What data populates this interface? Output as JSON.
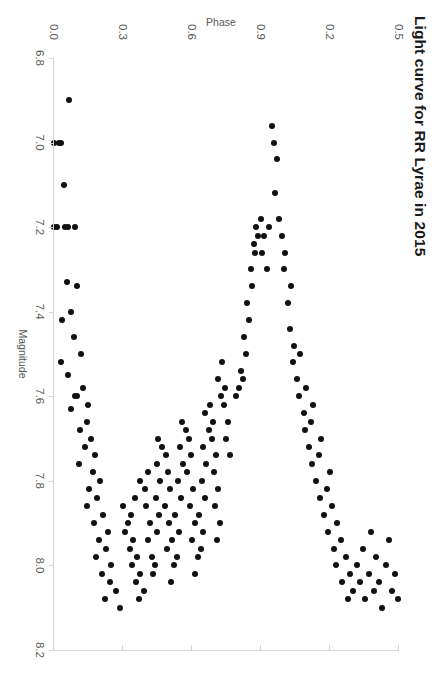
{
  "chart_data": {
    "type": "scatter",
    "title": "Light curve for RR Lyrae in 2015",
    "xlabel": "Magnitude",
    "ylabel": "Phase",
    "orientation": "rotated-90-clockwise",
    "grid": false,
    "legend": null,
    "xlim": [
      6.8,
      8.2
    ],
    "ylim": [
      0.0,
      1.5
    ],
    "xticks": [
      "6.8",
      "7.0",
      "7.2",
      "7.4",
      "7.6",
      "7.8",
      "8.0",
      "8.2"
    ],
    "xtick_values": [
      6.8,
      7.0,
      7.2,
      7.4,
      7.6,
      7.8,
      8.0,
      8.2
    ],
    "yticks": [
      "0.0",
      "0.3",
      "0.6",
      "0.9",
      "0.2",
      "0.5"
    ],
    "ytick_values": [
      0.0,
      0.3,
      0.6,
      0.9,
      1.2,
      1.5
    ],
    "marker": "filled-circle",
    "marker_color": "#111111",
    "marker_size_px": 6,
    "axis_color": "#d4d4d4",
    "tick_label_color": "#595959",
    "title_color": "#1a1a1a",
    "background": "#ffffff",
    "n_points": 163,
    "points": [
      [
        6.9,
        0.065
      ],
      [
        7.0,
        0.03
      ],
      [
        7.0,
        0.021
      ],
      [
        7.0,
        0.0
      ],
      [
        7.1,
        0.043
      ],
      [
        7.2,
        0.09
      ],
      [
        7.2,
        0.063
      ],
      [
        7.2,
        0.05
      ],
      [
        7.2,
        0.013
      ],
      [
        7.2,
        0.0
      ],
      [
        7.34,
        0.1
      ],
      [
        7.33,
        0.055
      ],
      [
        7.4,
        0.072
      ],
      [
        7.42,
        0.036
      ],
      [
        7.46,
        0.088
      ],
      [
        7.5,
        0.118
      ],
      [
        7.52,
        0.03
      ],
      [
        7.55,
        0.06
      ],
      [
        7.58,
        0.128
      ],
      [
        7.6,
        0.1
      ],
      [
        7.6,
        0.092
      ],
      [
        7.62,
        0.148
      ],
      [
        7.63,
        0.072
      ],
      [
        7.66,
        0.142
      ],
      [
        7.68,
        0.115
      ],
      [
        7.7,
        0.16
      ],
      [
        7.72,
        0.135
      ],
      [
        7.74,
        0.178
      ],
      [
        7.76,
        0.108
      ],
      [
        7.78,
        0.17
      ],
      [
        7.8,
        0.2
      ],
      [
        7.82,
        0.152
      ],
      [
        7.84,
        0.188
      ],
      [
        7.86,
        0.145
      ],
      [
        7.88,
        0.215
      ],
      [
        7.9,
        0.175
      ],
      [
        7.92,
        0.235
      ],
      [
        7.94,
        0.196
      ],
      [
        7.96,
        0.228
      ],
      [
        7.98,
        0.182
      ],
      [
        8.0,
        0.25
      ],
      [
        8.02,
        0.21
      ],
      [
        8.04,
        0.245
      ],
      [
        8.06,
        0.268
      ],
      [
        8.08,
        0.222
      ],
      [
        8.1,
        0.286
      ],
      [
        7.86,
        0.3
      ],
      [
        7.9,
        0.32
      ],
      [
        7.92,
        0.31
      ],
      [
        7.94,
        0.345
      ],
      [
        7.96,
        0.33
      ],
      [
        7.98,
        0.362
      ],
      [
        8.0,
        0.34
      ],
      [
        8.02,
        0.375
      ],
      [
        8.04,
        0.355
      ],
      [
        8.06,
        0.39
      ],
      [
        8.08,
        0.368
      ],
      [
        7.88,
        0.335
      ],
      [
        7.84,
        0.352
      ],
      [
        7.8,
        0.372
      ],
      [
        7.82,
        0.395
      ],
      [
        7.78,
        0.41
      ],
      [
        7.86,
        0.402
      ],
      [
        7.9,
        0.418
      ],
      [
        7.94,
        0.408
      ],
      [
        7.98,
        0.425
      ],
      [
        8.0,
        0.44
      ],
      [
        8.02,
        0.432
      ],
      [
        7.92,
        0.448
      ],
      [
        7.88,
        0.455
      ],
      [
        7.84,
        0.442
      ],
      [
        7.8,
        0.462
      ],
      [
        7.76,
        0.448
      ],
      [
        7.72,
        0.47
      ],
      [
        7.7,
        0.452
      ],
      [
        7.74,
        0.488
      ],
      [
        7.78,
        0.495
      ],
      [
        7.82,
        0.505
      ],
      [
        7.86,
        0.482
      ],
      [
        7.9,
        0.5
      ],
      [
        7.94,
        0.515
      ],
      [
        7.96,
        0.492
      ],
      [
        8.0,
        0.52
      ],
      [
        8.04,
        0.508
      ],
      [
        7.98,
        0.535
      ],
      [
        7.92,
        0.545
      ],
      [
        7.88,
        0.528
      ],
      [
        7.84,
        0.552
      ],
      [
        7.8,
        0.54
      ],
      [
        7.76,
        0.562
      ],
      [
        7.72,
        0.548
      ],
      [
        7.68,
        0.572
      ],
      [
        7.66,
        0.555
      ],
      [
        7.7,
        0.588
      ],
      [
        7.74,
        0.595
      ],
      [
        7.78,
        0.58
      ],
      [
        7.82,
        0.605
      ],
      [
        7.86,
        0.592
      ],
      [
        7.9,
        0.612
      ],
      [
        7.94,
        0.6
      ],
      [
        7.98,
        0.625
      ],
      [
        8.02,
        0.615
      ],
      [
        7.96,
        0.638
      ],
      [
        7.92,
        0.648
      ],
      [
        7.88,
        0.632
      ],
      [
        7.84,
        0.655
      ],
      [
        7.8,
        0.642
      ],
      [
        7.76,
        0.662
      ],
      [
        7.72,
        0.65
      ],
      [
        7.68,
        0.672
      ],
      [
        7.64,
        0.658
      ],
      [
        7.62,
        0.68
      ],
      [
        7.66,
        0.692
      ],
      [
        7.7,
        0.685
      ],
      [
        7.74,
        0.705
      ],
      [
        7.78,
        0.695
      ],
      [
        7.82,
        0.715
      ],
      [
        7.86,
        0.702
      ],
      [
        7.9,
        0.722
      ],
      [
        7.94,
        0.71
      ],
      [
        7.6,
        0.728
      ],
      [
        7.56,
        0.712
      ],
      [
        7.58,
        0.745
      ],
      [
        7.62,
        0.738
      ],
      [
        7.66,
        0.758
      ],
      [
        7.7,
        0.748
      ],
      [
        7.74,
        0.765
      ],
      [
        7.52,
        0.73
      ],
      [
        7.6,
        0.79
      ],
      [
        7.58,
        0.805
      ],
      [
        7.56,
        0.82
      ],
      [
        7.54,
        0.812
      ],
      [
        7.5,
        0.835
      ],
      [
        7.46,
        0.828
      ],
      [
        7.42,
        0.848
      ],
      [
        7.38,
        0.84
      ],
      [
        7.34,
        0.862
      ],
      [
        7.3,
        0.855
      ],
      [
        7.26,
        0.875
      ],
      [
        7.24,
        0.868
      ],
      [
        7.22,
        0.888
      ],
      [
        7.2,
        0.88
      ],
      [
        7.18,
        0.9
      ],
      [
        7.22,
        0.912
      ],
      [
        7.26,
        0.905
      ],
      [
        7.3,
        0.925
      ],
      [
        7.2,
        0.935
      ],
      [
        7.0,
        0.955
      ],
      [
        6.96,
        0.948
      ],
      [
        7.04,
        0.968
      ],
      [
        7.12,
        0.96
      ],
      [
        7.18,
        0.978
      ],
      [
        7.22,
        0.992
      ],
      [
        7.26,
        1.005
      ],
      [
        7.3,
        0.998
      ],
      [
        7.38,
        1.018
      ],
      [
        7.34,
        1.032
      ],
      [
        7.44,
        1.025
      ],
      [
        7.48,
        1.045
      ],
      [
        7.52,
        1.038
      ],
      [
        7.56,
        1.058
      ],
      [
        7.5,
        1.07
      ],
      [
        7.6,
        1.065
      ],
      [
        7.64,
        1.085
      ],
      [
        7.58,
        1.095
      ],
      [
        7.68,
        1.09
      ],
      [
        7.72,
        1.108
      ],
      [
        7.66,
        1.118
      ],
      [
        7.62,
        1.128
      ],
      [
        7.76,
        1.122
      ],
      [
        7.8,
        1.14
      ],
      [
        7.74,
        1.152
      ],
      [
        7.7,
        1.162
      ],
      [
        7.84,
        1.158
      ],
      [
        7.88,
        1.175
      ],
      [
        7.82,
        1.188
      ],
      [
        7.78,
        1.198
      ],
      [
        7.92,
        1.192
      ],
      [
        7.86,
        1.208
      ],
      [
        7.96,
        1.218
      ],
      [
        7.9,
        1.232
      ],
      [
        8.0,
        1.228
      ],
      [
        7.94,
        1.248
      ],
      [
        8.04,
        1.252
      ],
      [
        7.98,
        1.268
      ],
      [
        8.08,
        1.278
      ],
      [
        8.02,
        1.288
      ],
      [
        8.06,
        1.302
      ],
      [
        8.0,
        1.318
      ],
      [
        8.04,
        1.332
      ],
      [
        7.96,
        1.345
      ],
      [
        8.08,
        1.352
      ],
      [
        8.02,
        1.368
      ],
      [
        7.92,
        1.378
      ],
      [
        8.06,
        1.39
      ],
      [
        7.98,
        1.402
      ],
      [
        8.04,
        1.415
      ],
      [
        8.1,
        1.428
      ],
      [
        8.0,
        1.442
      ],
      [
        7.94,
        1.455
      ],
      [
        8.06,
        1.468
      ],
      [
        8.02,
        1.482
      ],
      [
        8.08,
        1.495
      ]
    ]
  }
}
